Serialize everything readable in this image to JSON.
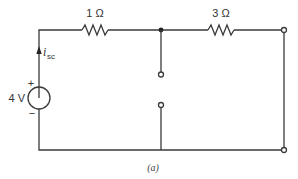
{
  "diagram": {
    "type": "circuit",
    "caption": "(a)",
    "source": {
      "label": "4 V",
      "plus": "+",
      "minus": "−"
    },
    "current": {
      "symbol": "i",
      "subscript": "sc"
    },
    "resistors": [
      {
        "id": "R1",
        "label": "1 Ω"
      },
      {
        "id": "R2",
        "label": "3 Ω"
      }
    ],
    "colors": {
      "wire": "#3a3a3a",
      "text": "#333333",
      "background": "#ffffff"
    }
  }
}
